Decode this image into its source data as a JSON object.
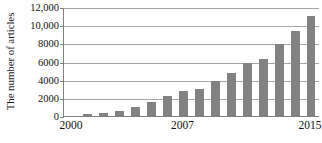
{
  "chart_data": {
    "type": "bar",
    "title": "",
    "subtitle": "",
    "xlabel": "",
    "ylabel": "The number of articles",
    "categories": [
      "2000",
      "2001",
      "2002",
      "2003",
      "2004",
      "2005",
      "2006",
      "2007",
      "2008",
      "2009",
      "2010",
      "2011",
      "2012",
      "2013",
      "2014",
      "2015"
    ],
    "values": [
      100,
      300,
      400,
      700,
      1100,
      1600,
      2300,
      2850,
      3050,
      4000,
      4850,
      5900,
      6400,
      8000,
      9450,
      11100
    ],
    "series": [
      {
        "name": "Number of articles",
        "values": [
          100,
          300,
          400,
          700,
          1100,
          1600,
          2300,
          2850,
          3050,
          4000,
          4850,
          5900,
          6400,
          8000,
          9450,
          11100
        ]
      }
    ],
    "ylim": [
      0,
      12000
    ],
    "y_ticks": [
      0,
      2000,
      4000,
      6000,
      8000,
      10000,
      12000
    ],
    "y_tick_labels": [
      "0",
      "2000",
      "4000",
      "6000",
      "8000",
      "10,000",
      "12,000"
    ],
    "x_tick_labels_shown": [
      "2000",
      "2007",
      "2015"
    ],
    "grid": true,
    "grid_axis": "y",
    "legend": false,
    "legend_position": "none",
    "bar_color": "#828282",
    "gridline_color": "#a6a6a6",
    "axis_color": "#808080",
    "text_color": "#111111"
  },
  "y_axis": {
    "title": "The number of articles",
    "ticks": [
      {
        "label": "12,000",
        "value": 12000
      },
      {
        "label": "10,000",
        "value": 10000
      },
      {
        "label": "8000",
        "value": 8000
      },
      {
        "label": "6000",
        "value": 6000
      },
      {
        "label": "4000",
        "value": 4000
      },
      {
        "label": "2000",
        "value": 2000
      },
      {
        "label": "0",
        "value": 0
      }
    ]
  },
  "x_axis": {
    "ticks": [
      {
        "label": "2000",
        "category_index": 0
      },
      {
        "label": "2007",
        "category_index": 7
      },
      {
        "label": "2015",
        "category_index": 15
      }
    ]
  }
}
